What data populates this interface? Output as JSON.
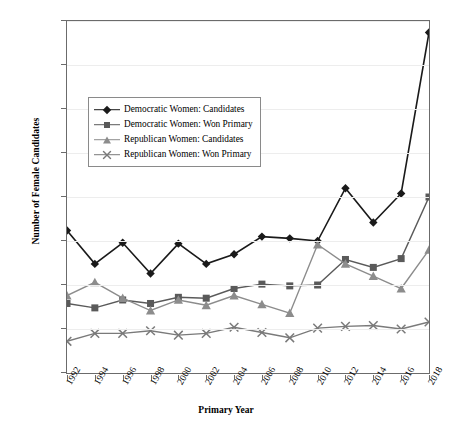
{
  "chart_data": {
    "type": "line",
    "title": "",
    "xlabel": "Primary Year",
    "ylabel": "Number of Female Candidates",
    "x": [
      1992,
      1994,
      1996,
      1998,
      2000,
      2002,
      2004,
      2006,
      2008,
      2010,
      2012,
      2014,
      2016,
      2018
    ],
    "categories": [
      "1992",
      "1994",
      "1996",
      "1998",
      "2000",
      "2002",
      "2004",
      "2006",
      "2008",
      "2010",
      "2012",
      "2014",
      "2016",
      "2018"
    ],
    "xlim": [
      1992,
      2018
    ],
    "ylim": [
      0,
      400
    ],
    "yticks": [
      0,
      50,
      100,
      150,
      200,
      250,
      300,
      350,
      400
    ],
    "ytick_labels": [
      "0",
      "50",
      "100",
      "150",
      "200",
      "250",
      "300",
      "350",
      "400"
    ],
    "grid": true,
    "legend_position": "upper-left-inside",
    "series": [
      {
        "name": "Democratic Women: Candidates",
        "marker": "diamond",
        "color": "#1a1a1a",
        "values": [
          162,
          124,
          148,
          113,
          147,
          124,
          135,
          155,
          153,
          150,
          210,
          171,
          204,
          387
        ]
      },
      {
        "name": "Democratic Women: Won Primary",
        "marker": "square",
        "color": "#5a5a5a",
        "values": [
          79,
          74,
          83,
          79,
          86,
          85,
          96,
          101,
          99,
          100,
          129,
          120,
          130,
          200
        ]
      },
      {
        "name": "Republican Women: Candidates",
        "marker": "triangle",
        "color": "#8c8c8c",
        "values": [
          88,
          103,
          85,
          71,
          83,
          77,
          88,
          78,
          68,
          146,
          124,
          110,
          96,
          140
        ]
      },
      {
        "name": "Republican Women: Won Primary",
        "marker": "x",
        "color": "#7a7a7a",
        "values": [
          36,
          45,
          45,
          48,
          43,
          45,
          52,
          46,
          40,
          51,
          53,
          54,
          50,
          58
        ]
      }
    ]
  },
  "legend": {
    "entries": [
      {
        "label": "Democratic Women: Candidates"
      },
      {
        "label": "Democratic Women: Won Primary"
      },
      {
        "label": "Republican Women: Candidates"
      },
      {
        "label": "Republican Women: Won Primary"
      }
    ]
  }
}
